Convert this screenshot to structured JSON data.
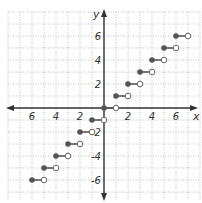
{
  "chart_data": {
    "type": "scatter",
    "title": "",
    "subtitle": "Step function y = floor(x) (greatest integer function)",
    "xlabel": "x",
    "ylabel": "y",
    "xlim": [
      -8,
      8
    ],
    "ylim": [
      -8,
      8
    ],
    "grid": true,
    "grid_style": "dotted",
    "x_tick_labels": [
      {
        "value": -6,
        "label": "6"
      },
      {
        "value": -4,
        "label": "4"
      },
      {
        "value": -2,
        "label": "2"
      },
      {
        "value": 2,
        "label": "2"
      },
      {
        "value": 4,
        "label": "4"
      },
      {
        "value": 6,
        "label": "6"
      }
    ],
    "y_tick_labels": [
      {
        "value": 6,
        "label": "6"
      },
      {
        "value": 4,
        "label": "4"
      },
      {
        "value": 2,
        "label": "2"
      },
      {
        "value": -2,
        "label": "-2"
      },
      {
        "value": -4,
        "label": "-4"
      },
      {
        "value": -6,
        "label": "-6"
      }
    ],
    "series": [
      {
        "name": "steps",
        "description": "Each segment: closed dot at left end (x0, y), open dot at right end (x1, y)",
        "segments": [
          {
            "x0": -6,
            "x1": -5,
            "y": -6
          },
          {
            "x0": -5,
            "x1": -4,
            "y": -5
          },
          {
            "x0": -4,
            "x1": -3,
            "y": -4
          },
          {
            "x0": -3,
            "x1": -2,
            "y": -3
          },
          {
            "x0": -2,
            "x1": -1,
            "y": -2
          },
          {
            "x0": -1,
            "x1": 0,
            "y": -1
          },
          {
            "x0": 0,
            "x1": 1,
            "y": 0
          },
          {
            "x0": 1,
            "x1": 2,
            "y": 1
          },
          {
            "x0": 2,
            "x1": 3,
            "y": 2
          },
          {
            "x0": 3,
            "x1": 4,
            "y": 3
          },
          {
            "x0": 4,
            "x1": 5,
            "y": 4
          },
          {
            "x0": 5,
            "x1": 6,
            "y": 5
          },
          {
            "x0": 6,
            "x1": 7,
            "y": 6
          }
        ]
      }
    ],
    "colors": {
      "grid": "#b0b0b0",
      "axis": "#333333",
      "closed_dot": "#555555",
      "open_dot_stroke": "#666666",
      "segment": "#555555"
    }
  },
  "layout": {
    "origin_px": [
      104,
      108
    ],
    "unit_px": 12,
    "grid_px": {
      "left": 8,
      "right": 200,
      "top": 12,
      "bottom": 200
    }
  }
}
